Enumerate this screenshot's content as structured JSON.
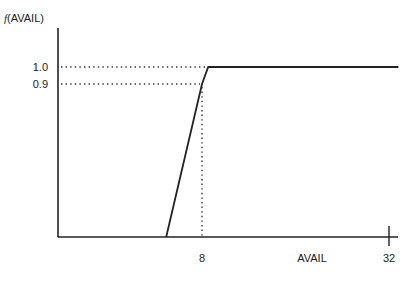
{
  "chart_data": {
    "type": "line",
    "title": "",
    "ylabel_func": "f",
    "ylabel_arg": "(AVAIL)",
    "xlabel": "AVAIL",
    "x_ticks": [
      {
        "value": 8,
        "label": "8"
      },
      {
        "value": 32,
        "label": "32"
      }
    ],
    "y_ticks": [
      {
        "value": 1.0,
        "label": "1.0"
      },
      {
        "value": 0.9,
        "label": "0.9"
      }
    ],
    "series": [
      {
        "name": "f(AVAIL)",
        "points": [
          {
            "x": 3.4,
            "y": 0.0
          },
          {
            "x": 8.0,
            "y": 0.9
          },
          {
            "x": 8.8,
            "y": 1.0
          },
          {
            "x": 33.2,
            "y": 1.0
          }
        ]
      }
    ],
    "reference_lines": [
      {
        "type": "horizontal",
        "y": 1.0,
        "x_to": 8.8,
        "style": "dotted"
      },
      {
        "type": "horizontal",
        "y": 0.9,
        "x_to": 8.0,
        "style": "dotted"
      },
      {
        "type": "vertical",
        "x": 8.0,
        "y_to": 0.9,
        "style": "dotted"
      }
    ],
    "xlim": [
      0.5,
      33.4
    ],
    "ylim": [
      0.0,
      1.2
    ],
    "grid": false,
    "legend": "none"
  }
}
